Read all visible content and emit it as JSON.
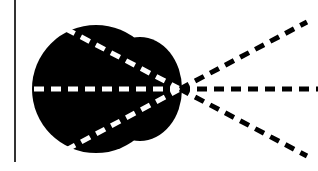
{
  "diagram": {
    "type": "ray-diagram",
    "background": "#ffffff",
    "colors": {
      "blob": "#000000",
      "inner_rays": "#ffffff",
      "outer_rays": "#000000",
      "boundary_line": "#333333"
    },
    "boundary_line": {
      "x": 15,
      "y1": 0,
      "y2": 162
    },
    "focal_point": {
      "x": 180,
      "y": 89
    },
    "blob": {
      "main_circle": {
        "cx": 96,
        "cy": 89,
        "r": 64
      },
      "right_bulge": {
        "cx": 140,
        "cy": 89,
        "rx": 42,
        "ry": 52
      }
    },
    "inner_rays": [
      {
        "x": 66,
        "y": 29
      },
      {
        "x": 28,
        "y": 89
      },
      {
        "x": 66,
        "y": 150
      }
    ],
    "outer_rays": [
      {
        "x": 307,
        "y": 22
      },
      {
        "x": 318,
        "y": 89
      },
      {
        "x": 307,
        "y": 156
      }
    ]
  }
}
